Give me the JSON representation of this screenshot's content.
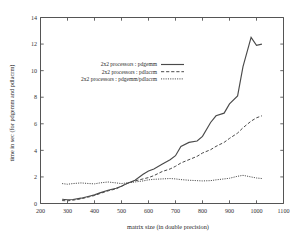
{
  "chart_data": {
    "type": "line",
    "title": "",
    "xlabel": "matrix size (in double precision)",
    "ylabel": "time in sec (for pdgemm and pdlacrm)",
    "xlim": [
      200,
      1100
    ],
    "ylim": [
      0,
      14
    ],
    "xticks": [
      200,
      300,
      400,
      500,
      600,
      700,
      800,
      900,
      1000,
      1100
    ],
    "yticks": [
      0,
      2,
      4,
      6,
      8,
      10,
      12,
      14
    ],
    "grid": false,
    "legend_position": "upper-left-inset",
    "series": [
      {
        "name": "2x2 processors : pdgemm",
        "style": "solid",
        "x": [
          280,
          300,
          320,
          350,
          380,
          400,
          420,
          450,
          480,
          500,
          520,
          550,
          580,
          600,
          620,
          650,
          680,
          700,
          720,
          750,
          780,
          800,
          830,
          850,
          880,
          900,
          930,
          950,
          980,
          1000,
          1020
        ],
        "y": [
          0.32,
          0.28,
          0.3,
          0.4,
          0.55,
          0.65,
          0.8,
          1.0,
          1.15,
          1.3,
          1.5,
          1.75,
          2.2,
          2.45,
          2.6,
          2.95,
          3.3,
          3.6,
          4.3,
          4.6,
          4.7,
          5.05,
          6.1,
          6.6,
          6.8,
          7.5,
          8.1,
          10.3,
          12.5,
          11.9,
          12.0
        ]
      },
      {
        "name": "2x2 processors : pdlacrm",
        "style": "dashed",
        "x": [
          280,
          300,
          320,
          350,
          380,
          400,
          420,
          450,
          480,
          500,
          520,
          550,
          580,
          600,
          620,
          650,
          680,
          700,
          720,
          750,
          780,
          800,
          830,
          850,
          880,
          900,
          930,
          950,
          980,
          1000,
          1020
        ],
        "y": [
          0.22,
          0.2,
          0.25,
          0.35,
          0.5,
          0.6,
          0.75,
          0.95,
          1.1,
          1.3,
          1.5,
          1.7,
          1.85,
          1.95,
          2.1,
          2.4,
          2.6,
          2.8,
          3.05,
          3.3,
          3.55,
          3.8,
          4.05,
          4.3,
          4.6,
          4.9,
          5.3,
          5.7,
          6.2,
          6.45,
          6.6
        ]
      },
      {
        "name": "2x2 processors : pdgemm/pdlacrm",
        "style": "dotted",
        "x": [
          280,
          300,
          320,
          350,
          380,
          400,
          420,
          450,
          480,
          500,
          520,
          550,
          580,
          600,
          620,
          650,
          680,
          700,
          720,
          750,
          780,
          800,
          830,
          850,
          880,
          900,
          930,
          950,
          980,
          1000,
          1020
        ],
        "y": [
          1.5,
          1.45,
          1.5,
          1.55,
          1.5,
          1.48,
          1.55,
          1.62,
          1.55,
          1.5,
          1.55,
          1.62,
          1.7,
          1.78,
          1.82,
          1.85,
          1.88,
          1.85,
          1.8,
          1.75,
          1.72,
          1.7,
          1.72,
          1.78,
          1.85,
          1.9,
          2.05,
          2.12,
          2.0,
          1.92,
          1.88
        ]
      }
    ],
    "legend": [
      {
        "label": "2x2 processors : pdgemm",
        "style": "solid"
      },
      {
        "label": "2x2 processors : pdlacrm",
        "style": "dashed"
      },
      {
        "label": "2x2 processors : pdgemm/pdlacrm",
        "style": "dotted"
      }
    ]
  }
}
